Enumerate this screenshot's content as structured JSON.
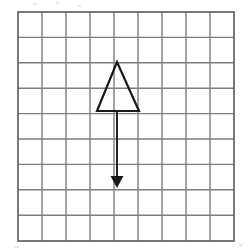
{
  "figure": {
    "background_color": "#ffffff",
    "canvas": {
      "width": 250,
      "height": 252
    }
  },
  "grid": {
    "name": "square-grid",
    "columns": 9,
    "rows": 9,
    "cell_width": 24,
    "cell_height": 25.4,
    "origin_x": 18,
    "origin_y": 12,
    "width": 216,
    "height": 229,
    "line_color": "#7d7d7d",
    "line_width": 1.4,
    "border_color": "#6a6a6a",
    "border_width": 1.8,
    "fill_color": "#ffffff"
  },
  "shapes": {
    "triangle": {
      "name": "triangle-outline",
      "label": "triangle",
      "points": "117,62 139,111 97,111",
      "apex": {
        "x": 117,
        "y": 62
      },
      "base_left": {
        "x": 97,
        "y": 111
      },
      "base_right": {
        "x": 139,
        "y": 111
      },
      "stroke_color": "#1a1a1a",
      "stroke_width": 2.2,
      "fill": "none"
    },
    "arrow": {
      "name": "translation-arrow",
      "label": "translation vector",
      "direction": "down",
      "shaft_x": 117,
      "shaft_y_start": 111,
      "shaft_y_end": 180,
      "tip": {
        "x": 117,
        "y": 188
      },
      "head_points": "117,188 110.5,176 123.5,176",
      "stroke_color": "#1a1a1a",
      "stroke_width": 1.9,
      "head_fill": "#1a1a1a",
      "length_cells": 3
    }
  },
  "artifacts": [
    {
      "name": "scan-speck",
      "x": 33,
      "y": 3,
      "width": 4,
      "height": 2
    },
    {
      "name": "scan-speck",
      "x": 56,
      "y": 2,
      "width": 3,
      "height": 2
    },
    {
      "name": "scan-speck",
      "x": 78,
      "y": 5,
      "width": 3,
      "height": 2
    },
    {
      "name": "scan-speck",
      "x": 14,
      "y": 246,
      "width": 5,
      "height": 2
    },
    {
      "name": "scan-speck",
      "x": 239,
      "y": 244,
      "width": 3,
      "height": 3
    }
  ]
}
